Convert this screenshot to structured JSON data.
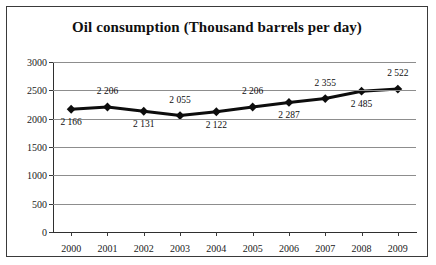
{
  "chart_data": {
    "type": "line",
    "title": "Oil consumption (Thousand barrels per day)",
    "xlabel": "",
    "ylabel": "",
    "categories": [
      "2000",
      "2001",
      "2002",
      "2003",
      "2004",
      "2005",
      "2006",
      "2007",
      "2008",
      "2009"
    ],
    "values": [
      2166,
      2206,
      2131,
      2055,
      2122,
      2206,
      2287,
      2355,
      2485,
      2522
    ],
    "point_labels": [
      "2 166",
      "2 206",
      "2 131",
      "2 055",
      "2 122",
      "2 206",
      "2 287",
      "2 355",
      "2 485",
      "2 522"
    ],
    "label_positions": [
      "below",
      "above",
      "below",
      "above",
      "below",
      "above",
      "below",
      "above",
      "below",
      "above"
    ],
    "ylim": [
      0,
      3000
    ],
    "yticks": [
      0,
      500,
      1000,
      1500,
      2000,
      2500,
      3000
    ],
    "ytick_labels": [
      "0",
      "500",
      "1000",
      "1500",
      "2000",
      "2500",
      "3000"
    ],
    "grid": true,
    "grid_axis": "y",
    "legend": false,
    "marker": "diamond",
    "series_color": "#0d0d0d",
    "grid_color": "#8d8d8d",
    "axis_color": "#2f2f2f",
    "background": "#ffffff"
  }
}
